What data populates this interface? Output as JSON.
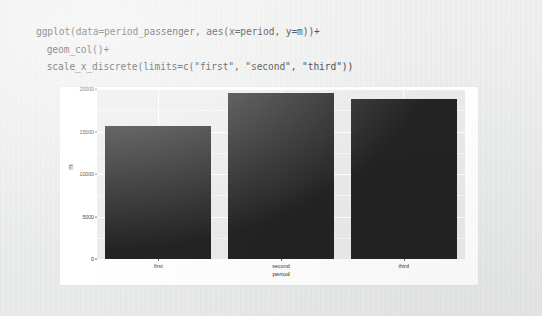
{
  "code": {
    "lines": [
      "ggplot(data=period_passenger, aes(x=period, y=m))+",
      " geom_col()+",
      " scale_x_discrete(limits=c(\"first\", \"second\", \"third\"))"
    ]
  },
  "chart_data": {
    "type": "bar",
    "title": "",
    "subtitle": "",
    "categories": [
      "first",
      "second",
      "third"
    ],
    "values": [
      15650,
      19530,
      18800
    ],
    "series": [
      {
        "name": "m",
        "values": [
          15650,
          19530,
          18800
        ]
      }
    ],
    "xlabel": "period",
    "ylabel": "m",
    "ylim": [
      0,
      20000
    ],
    "y_ticks": [
      0,
      5000,
      10000,
      15000,
      20000
    ],
    "y_tick_labels": [
      "0",
      "5000",
      "10000",
      "15000",
      "20000"
    ],
    "grid": true,
    "legend": "none",
    "bar_color": "#232323",
    "panel_color": "#ebebeb",
    "gridline_color": "#ffffff",
    "plot_background": "#ffffff"
  }
}
